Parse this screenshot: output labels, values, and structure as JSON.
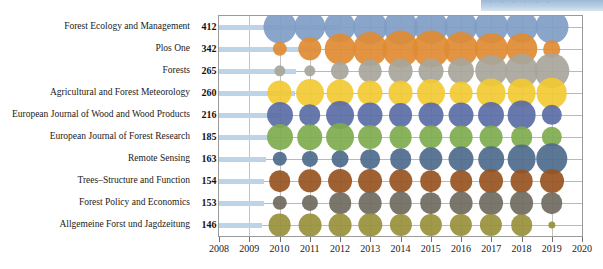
{
  "watermark": {
    "text": "· · · · · ·"
  },
  "chart_data": {
    "type": "scatter",
    "title": "",
    "xlabel": "",
    "ylabel": "",
    "xlim": [
      2008,
      2020
    ],
    "xticks": [
      2008,
      2009,
      2010,
      2011,
      2012,
      2013,
      2014,
      2015,
      2016,
      2017,
      2018,
      2019,
      2020
    ],
    "grid": true,
    "legend": "none",
    "x": [
      2010,
      2011,
      2012,
      2013,
      2014,
      2015,
      2016,
      2017,
      2018,
      2019
    ],
    "categories": [
      "Forest Ecology and Management",
      "Plos One",
      "Forests",
      "Agricultural and Forest Meteorology",
      "European Journal of Wood and Wood Products",
      "European Journal of Forest Research",
      "Remote Sensing",
      "Trees–Structure and Function",
      "Forest Policy and Economics",
      "Allgemeine Forst und Jagdzeitung"
    ],
    "totals": [
      412,
      342,
      265,
      260,
      216,
      185,
      163,
      154,
      153,
      146
    ],
    "colors": [
      "#7f9dc4",
      "#df8b33",
      "#a8a59b",
      "#f2c932",
      "#5a6da5",
      "#7fab4e",
      "#4e6a8c",
      "#97541f",
      "#6f6a60",
      "#97903a"
    ],
    "series": [
      {
        "name": "Forest Ecology and Management",
        "values": [
          42,
          38,
          38,
          44,
          46,
          45,
          43,
          43,
          40,
          42
        ]
      },
      {
        "name": "Plos One",
        "values": [
          8,
          21,
          36,
          44,
          52,
          52,
          44,
          40,
          38,
          12
        ]
      },
      {
        "name": "Forests",
        "values": [
          5,
          5,
          13,
          20,
          24,
          24,
          26,
          38,
          44,
          48
        ]
      },
      {
        "name": "Agricultural and Forest Meteorology",
        "values": [
          24,
          30,
          28,
          24,
          24,
          30,
          20,
          32,
          32,
          36
        ]
      },
      {
        "name": "European Journal of Wood and Wood Products",
        "values": [
          26,
          18,
          30,
          24,
          22,
          24,
          24,
          26,
          32,
          16
        ]
      },
      {
        "name": "European Journal of Forest Research",
        "values": [
          26,
          25,
          30,
          22,
          20,
          21,
          20,
          20,
          18,
          16
        ]
      },
      {
        "name": "Remote Sensing",
        "values": [
          8,
          10,
          11,
          15,
          18,
          21,
          24,
          25,
          32,
          38
        ]
      },
      {
        "name": "Trees–Structure and Function",
        "values": [
          18,
          21,
          22,
          22,
          21,
          18,
          18,
          22,
          20,
          22
        ]
      },
      {
        "name": "Forest Policy and Economics",
        "values": [
          8,
          10,
          18,
          20,
          20,
          18,
          20,
          22,
          22,
          18
        ]
      },
      {
        "name": "Allgemeine Forst und Jagdzeitung",
        "values": [
          20,
          20,
          20,
          21,
          19,
          19,
          19,
          19,
          18,
          2
        ]
      }
    ]
  }
}
